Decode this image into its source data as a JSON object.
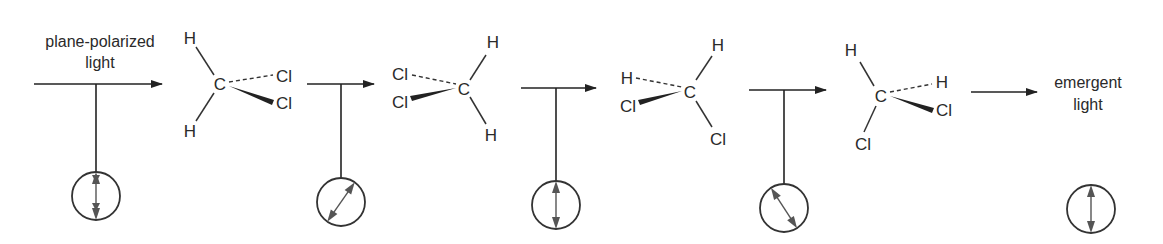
{
  "diagram": {
    "labels": {
      "input": [
        "plane-polarized",
        "light"
      ],
      "output": [
        "emergent",
        "light"
      ]
    },
    "atoms": {
      "carbon": "C",
      "hydrogen": "H",
      "chlorine": "Cl"
    },
    "stages": [
      {
        "id": "incident",
        "polarization_angle_deg": 0,
        "arrow": {
          "x1": 34,
          "x2": 162,
          "y": 84
        },
        "stem_x": 96,
        "circle": {
          "cx": 96,
          "cy": 196
        }
      },
      {
        "id": "after-molecule-1",
        "polarization_angle_deg": 30,
        "arrow": {
          "x1": 307,
          "x2": 374,
          "y": 84
        },
        "stem_x": 341,
        "circle": {
          "cx": 341,
          "cy": 202
        }
      },
      {
        "id": "after-molecule-2",
        "polarization_angle_deg": 0,
        "arrow": {
          "x1": 521,
          "x2": 596,
          "y": 88
        },
        "stem_x": 556,
        "circle": {
          "cx": 556,
          "cy": 205
        }
      },
      {
        "id": "after-molecule-3",
        "polarization_angle_deg": -30,
        "arrow": {
          "x1": 749,
          "x2": 826,
          "y": 90
        },
        "stem_x": 784,
        "circle": {
          "cx": 784,
          "cy": 208
        }
      },
      {
        "id": "emergent",
        "polarization_angle_deg": 0,
        "arrow": {
          "x1": 971,
          "x2": 1037,
          "y": 92
        },
        "stem_x": null,
        "circle": {
          "cx": 1082,
          "cy": 209
        }
      }
    ],
    "molecules": [
      {
        "name": "CH2Cl2 orientation 1",
        "C": [
          220,
          84
        ],
        "substituents": [
          {
            "atom": "H",
            "pos": [
              190,
              44
            ],
            "bond": "plain"
          },
          {
            "atom": "Cl",
            "pos": [
              284,
              78
            ],
            "bond": "dashed"
          },
          {
            "atom": "Cl",
            "pos": [
              284,
              106
            ],
            "bond": "wedge"
          },
          {
            "atom": "H",
            "pos": [
              190,
              134
            ],
            "bond": "plain"
          }
        ]
      },
      {
        "name": "CH2Cl2 orientation 2",
        "C": [
          464,
          89
        ],
        "substituents": [
          {
            "atom": "Cl",
            "pos": [
              400,
              77
            ],
            "bond": "dashed"
          },
          {
            "atom": "Cl",
            "pos": [
              400,
              106
            ],
            "bond": "wedge"
          },
          {
            "atom": "H",
            "pos": [
              493,
              48
            ],
            "bond": "plain"
          },
          {
            "atom": "H",
            "pos": [
              491,
              139
            ],
            "bond": "plain"
          }
        ]
      },
      {
        "name": "CH2Cl2 orientation 3",
        "C": [
          690,
          93
        ],
        "substituents": [
          {
            "atom": "H",
            "pos": [
              718,
              51
            ],
            "bond": "plain"
          },
          {
            "atom": "H",
            "pos": [
              625,
              82
            ],
            "bond": "dashed"
          },
          {
            "atom": "Cl",
            "pos": [
              627,
              110
            ],
            "bond": "wedge"
          },
          {
            "atom": "Cl",
            "pos": [
              718,
              143
            ],
            "bond": "plain"
          }
        ]
      },
      {
        "name": "CH2Cl2 orientation 4",
        "C": [
          881,
          97
        ],
        "substituents": [
          {
            "atom": "H",
            "pos": [
              851,
              54
            ],
            "bond": "plain"
          },
          {
            "atom": "H",
            "pos": [
              942,
              85
            ],
            "bond": "dashed"
          },
          {
            "atom": "Cl",
            "pos": [
              943,
              114
            ],
            "bond": "wedge"
          },
          {
            "atom": "Cl",
            "pos": [
              862,
              150
            ],
            "bond": "plain"
          }
        ]
      }
    ]
  }
}
